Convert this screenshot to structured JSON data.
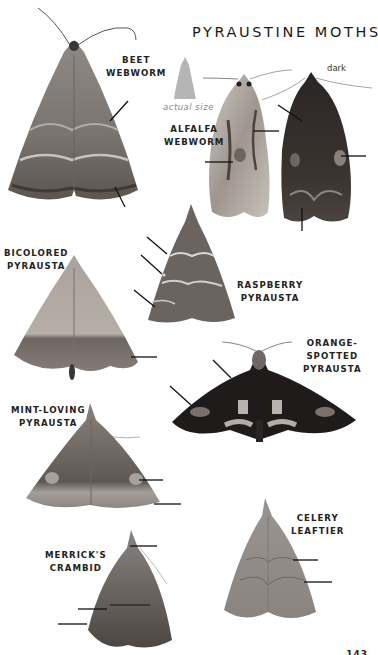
{
  "page": {
    "title": "PYRAUSTINE MOTHS",
    "page_number": "143",
    "actual_size_caption": "actual size"
  },
  "species": [
    {
      "id": "beet-webworm",
      "name_line1": "BEET",
      "name_line2": "WEBWORM",
      "pointer_arrows": 2,
      "color": "#8e8a86"
    },
    {
      "id": "alfalfa-webworm",
      "name_line1": "ALFALFA",
      "name_line2": "WEBWORM",
      "pointer_arrows": 4,
      "variants": [
        {
          "label": "",
          "color": "#bdb6ad"
        },
        {
          "label": "dark",
          "color": "#2b2624"
        }
      ]
    },
    {
      "id": "bicolored-pyrausta",
      "name_line1": "BICOLORED",
      "name_line2": "PYRAUSTA",
      "pointer_arrows": 1,
      "color": "#a39a92"
    },
    {
      "id": "raspberry-pyrausta",
      "name_line1": "RASPBERRY",
      "name_line2": "PYRAUSTA",
      "pointer_arrows": 3,
      "color": "#6d6461"
    },
    {
      "id": "orange-spotted-pyrausta",
      "name_line1": "ORANGE-",
      "name_line2": "SPOTTED",
      "name_line3": "PYRAUSTA",
      "pointer_arrows": 2,
      "color": "#1e1a1a"
    },
    {
      "id": "mint-loving-pyrausta",
      "name_line1": "MINT-LOVING",
      "name_line2": "PYRAUSTA",
      "pointer_arrows": 2,
      "color": "#736a65"
    },
    {
      "id": "merricks-crambid",
      "name_line1": "MERRICK'S",
      "name_line2": "CRAMBID",
      "pointer_arrows": 3,
      "color": "#5f5955"
    },
    {
      "id": "celery-leaftier",
      "name_line1": "CELERY",
      "name_line2": "LEAFTIER",
      "pointer_arrows": 2,
      "color": "#8e8884"
    }
  ]
}
